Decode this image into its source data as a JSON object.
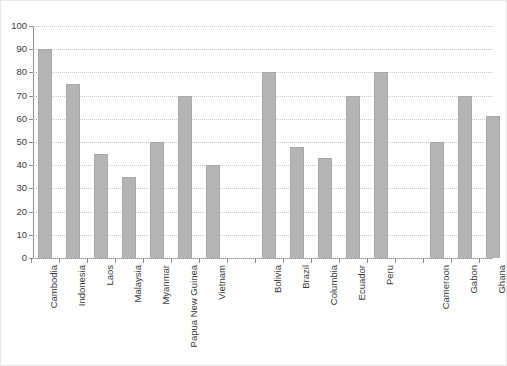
{
  "chart_data": {
    "type": "bar",
    "title": "",
    "xlabel": "",
    "ylabel": "",
    "ylim": [
      0,
      100
    ],
    "yticks": [
      0,
      10,
      20,
      30,
      40,
      50,
      60,
      70,
      80,
      90,
      100
    ],
    "grid": true,
    "legend": "none",
    "orientation": "vertical",
    "bar_color": "#b4b4b4",
    "groups": [
      {
        "name": "",
        "categories": [
          "Cambodia",
          "Indonesia",
          "Laos",
          "Malaysia",
          "Myanmar",
          "Papua New Guinea",
          "Vietnam"
        ],
        "values": [
          90,
          75,
          45,
          35,
          50,
          70,
          40
        ]
      },
      {
        "name": "",
        "categories": [
          "Bolivia",
          "Brazil",
          "Columbia",
          "Ecuador",
          "Peru"
        ],
        "values": [
          80,
          48,
          43,
          70,
          80
        ]
      },
      {
        "name": "",
        "categories": [
          "Cameroon",
          "Gabon",
          "Ghana"
        ],
        "values": [
          50,
          70,
          61
        ]
      }
    ],
    "categories": [
      "Cambodia",
      "Indonesia",
      "Laos",
      "Malaysia",
      "Myanmar",
      "Papua New Guinea",
      "Vietnam",
      "Bolivia",
      "Brazil",
      "Columbia",
      "Ecuador",
      "Peru",
      "Cameroon",
      "Gabon",
      "Ghana"
    ],
    "values": [
      90,
      75,
      45,
      35,
      50,
      70,
      40,
      80,
      48,
      43,
      70,
      80,
      50,
      70,
      61
    ]
  },
  "colors": {
    "bar": "#b4b4b4",
    "bar_edge": "#a8a8a8",
    "axis": "#8c8c8c",
    "grid": "#c9c9c9",
    "text": "#3b3b3b",
    "background": "#ffffff"
  }
}
